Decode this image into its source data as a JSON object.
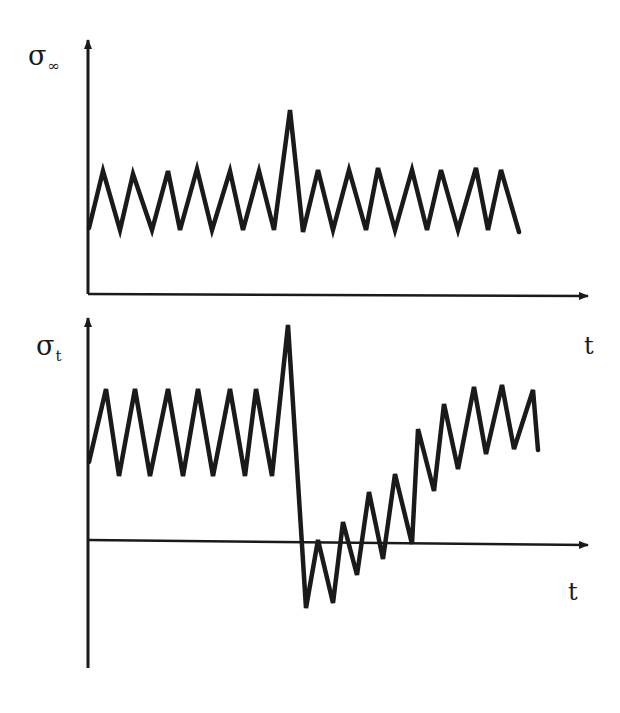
{
  "diagram": {
    "colors": {
      "ink": "#1a1a1a",
      "background": "#ffffff"
    },
    "top_plot": {
      "y_label_symbol": "σ",
      "y_label_subscript": "∞",
      "x_label": "t",
      "signal_points": "89,228 103,171 120,230 133,174 152,230 168,171 180,230 197,169 212,230 230,171 243,230 259,171 274,230 290,110 303,232 318,170 333,230 349,170 366,230 378,168 395,230 412,170 427,230 441,170 458,230 476,168 488,230 501,170 519,232",
      "description": "Cyclic (constant-amplitude) far-field stress with a single overload peak"
    },
    "bottom_plot": {
      "y_label_symbol": "σ",
      "y_label_subscript": "t",
      "x_label": "t",
      "signal_points": "89,462 106,389 119,476 135,389 150,476 168,389 183,476 198,389 213,476 230,389 245,476 256,389 272,476 288,325 306,608 318,540 333,603 343,522 357,575 369,492 383,559 395,474 412,544 418,429 434,491 444,404 458,469 474,387 486,454 502,385 514,449 533,390 538,450",
      "description": "Local crack-tip stress: overload causes compressive residual stress, then gradual recovery"
    }
  }
}
